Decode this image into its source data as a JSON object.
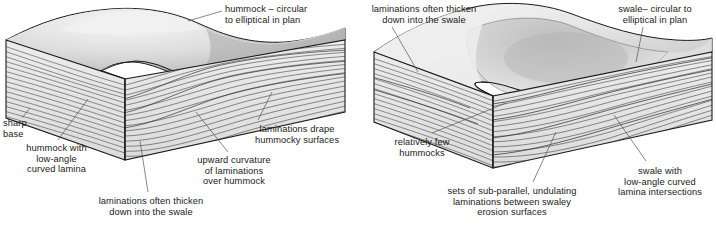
{
  "figure": {
    "panels": [
      {
        "id": "left-panel",
        "name": "hummocky-cross-stratification-block",
        "labels": [
          {
            "id": "hummock-plan",
            "text": "hummock – circular\nto elliptical in plan"
          },
          {
            "id": "sharp-base",
            "text": "sharp\nbase"
          },
          {
            "id": "hummock-low-angle",
            "text": "hummock with\nlow-angle\ncurved lamina"
          },
          {
            "id": "laminations-drape",
            "text": "laminations drape\nhummocky surfaces"
          },
          {
            "id": "upward-curvature",
            "text": "upward curvature\nof laminations\nover hummock"
          },
          {
            "id": "thicken-into-swale",
            "text": "laminations often thicken\ndown into the swale"
          }
        ]
      },
      {
        "id": "right-panel",
        "name": "swaley-cross-stratification-block",
        "labels": [
          {
            "id": "thicken-into-swale-r",
            "text": "laminations often thicken\ndown into the swale"
          },
          {
            "id": "swale-plan",
            "text": "swale– circular to\nelliptical in plan"
          },
          {
            "id": "relatively-few",
            "text": "relatively few\nhummocks"
          },
          {
            "id": "sub-parallel-sets",
            "text": "sets of sub-parallel, undulating\nlaminations between swaley\nerosion surfaces"
          },
          {
            "id": "swale-low-angle",
            "text": "swale with\nlow-angle curved\nlamina intersections"
          }
        ]
      }
    ],
    "colors": {
      "outline": "#1a1a1a",
      "lamina": "#333333",
      "top_light": "#ececec",
      "top_mid": "#cfcfcf",
      "top_dark": "#9a9a9a",
      "face_fill": "#e4e4e4",
      "leader": "#555555",
      "background": "#ffffff",
      "text": "#1a1a1a"
    }
  }
}
